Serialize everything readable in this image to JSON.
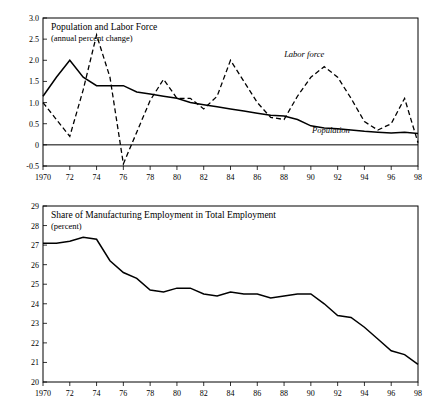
{
  "chart_data": [
    {
      "type": "line",
      "title": "Population and Labor Force",
      "subtitle": "(annual percent change)",
      "xlabel": "",
      "ylabel": "",
      "xlim": [
        1970,
        1998
      ],
      "ylim": [
        -0.5,
        3.0
      ],
      "ytick_labels": [
        "3.0",
        "2.5",
        "2.0",
        "1.5",
        "1.0",
        "0.5",
        "0",
        "-0.5"
      ],
      "ytick_values": [
        3.0,
        2.5,
        2.0,
        1.5,
        1.0,
        0.5,
        0.0,
        -0.5
      ],
      "xtick_labels": [
        "1970",
        "72",
        "74",
        "76",
        "78",
        "80",
        "82",
        "84",
        "86",
        "88",
        "90",
        "92",
        "94",
        "96",
        "98"
      ],
      "xtick_values": [
        1970,
        1972,
        1974,
        1976,
        1978,
        1980,
        1982,
        1984,
        1986,
        1988,
        1990,
        1992,
        1994,
        1996,
        1998
      ],
      "grid": false,
      "legend_position": "inline-annotation",
      "annotations": [
        {
          "text": "Labor force",
          "x": 1989.5,
          "y": 2.07
        },
        {
          "text": "Population",
          "x": 1991.5,
          "y": 0.27
        }
      ],
      "series": [
        {
          "name": "Labor force",
          "style": "dashed",
          "x": [
            1970,
            1971,
            1972,
            1973,
            1974,
            1975,
            1976,
            1977,
            1978,
            1979,
            1980,
            1981,
            1982,
            1983,
            1984,
            1985,
            1986,
            1987,
            1988,
            1989,
            1990,
            1991,
            1992,
            1993,
            1994,
            1995,
            1996,
            1997,
            1998
          ],
          "values": [
            1.0,
            0.6,
            0.2,
            1.3,
            2.6,
            1.6,
            -0.45,
            0.3,
            1.05,
            1.55,
            1.1,
            1.1,
            0.85,
            1.15,
            2.0,
            1.5,
            1.0,
            0.65,
            0.6,
            1.15,
            1.6,
            1.85,
            1.6,
            1.1,
            0.55,
            0.35,
            0.5,
            1.1,
            0.05
          ]
        },
        {
          "name": "Population",
          "style": "solid",
          "x": [
            1970,
            1971,
            1972,
            1973,
            1974,
            1975,
            1976,
            1977,
            1978,
            1979,
            1980,
            1981,
            1982,
            1983,
            1984,
            1985,
            1986,
            1987,
            1988,
            1989,
            1990,
            1991,
            1992,
            1993,
            1994,
            1995,
            1996,
            1997,
            1998
          ],
          "values": [
            1.15,
            1.6,
            2.0,
            1.6,
            1.4,
            1.4,
            1.4,
            1.25,
            1.2,
            1.15,
            1.1,
            1.0,
            0.95,
            0.9,
            0.85,
            0.8,
            0.75,
            0.7,
            0.68,
            0.6,
            0.45,
            0.4,
            0.38,
            0.35,
            0.32,
            0.3,
            0.28,
            0.3,
            0.27
          ]
        }
      ]
    },
    {
      "type": "line",
      "title": "Share of Manufacturing Employment in Total Employment",
      "subtitle": "(percent)",
      "xlabel": "",
      "ylabel": "",
      "xlim": [
        1970,
        1998
      ],
      "ylim": [
        20,
        29
      ],
      "ytick_labels": [
        "29",
        "28",
        "27",
        "26",
        "25",
        "24",
        "23",
        "22",
        "21",
        "20"
      ],
      "ytick_values": [
        29,
        28,
        27,
        26,
        25,
        24,
        23,
        22,
        21,
        20
      ],
      "xtick_labels": [
        "1970",
        "72",
        "74",
        "76",
        "78",
        "80",
        "82",
        "84",
        "86",
        "88",
        "90",
        "92",
        "94",
        "96",
        "98"
      ],
      "xtick_values": [
        1970,
        1972,
        1974,
        1976,
        1978,
        1980,
        1982,
        1984,
        1986,
        1988,
        1990,
        1992,
        1994,
        1996,
        1998
      ],
      "grid": false,
      "legend_position": "none",
      "annotations": [],
      "series": [
        {
          "name": "Share of manufacturing employment",
          "style": "solid",
          "x": [
            1970,
            1971,
            1972,
            1973,
            1974,
            1975,
            1976,
            1977,
            1978,
            1979,
            1980,
            1981,
            1982,
            1983,
            1984,
            1985,
            1986,
            1987,
            1988,
            1989,
            1990,
            1991,
            1992,
            1993,
            1994,
            1995,
            1996,
            1997,
            1998
          ],
          "values": [
            27.1,
            27.1,
            27.2,
            27.4,
            27.3,
            26.2,
            25.6,
            25.3,
            24.7,
            24.6,
            24.8,
            24.8,
            24.5,
            24.4,
            24.6,
            24.5,
            24.5,
            24.3,
            24.4,
            24.5,
            24.5,
            24.0,
            23.4,
            23.3,
            22.8,
            22.2,
            21.6,
            21.4,
            20.9
          ]
        }
      ]
    }
  ]
}
